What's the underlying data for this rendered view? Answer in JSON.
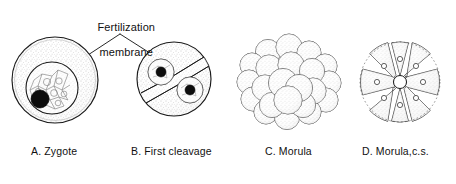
{
  "figure": {
    "width": 456,
    "height": 184,
    "background": "#ffffff",
    "ink_color": "#111111",
    "stipple_color": "#8d8d8d",
    "nucleus_color": "#0d0d0d"
  },
  "callout": {
    "label_line1": "Fertilization",
    "label_line2": "membrane",
    "x": 120,
    "y": 8,
    "apex": {
      "x": 120,
      "y": 34
    },
    "left_target": {
      "x": 88,
      "y": 54
    },
    "right_target": {
      "x": 152,
      "y": 54
    }
  },
  "panels": [
    {
      "id": "A",
      "caption": "A. Zygote",
      "caption_x": 31,
      "caption_y": 145,
      "type": "zygote",
      "center": {
        "x": 55,
        "y": 80
      },
      "radius": 43,
      "inner": {
        "center": {
          "x": 52,
          "y": 88
        },
        "radius": 26,
        "pattern": "polygonal-web"
      },
      "nucleus": {
        "x": 40,
        "y": 99,
        "radius": 9,
        "fill": "solid"
      }
    },
    {
      "id": "B",
      "caption": "B. First cleavage",
      "caption_x": 131,
      "caption_y": 145,
      "type": "first-cleavage",
      "center": {
        "x": 174,
        "y": 79
      },
      "radius": 37,
      "furrow": {
        "angle_deg": -31,
        "gap": 7
      },
      "nuclei": [
        {
          "x": 161,
          "y": 72,
          "radius": 5.0,
          "halo_radius": 13
        },
        {
          "x": 190,
          "y": 90,
          "radius": 5.0,
          "halo_radius": 13
        }
      ]
    },
    {
      "id": "C",
      "caption": "C. Morula",
      "caption_x": 265,
      "caption_y": 145,
      "type": "morula",
      "center": {
        "x": 289,
        "y": 82
      },
      "radius": 44,
      "blastomere_count": 22,
      "blastomere_radius": 13
    },
    {
      "id": "D",
      "caption": "D. Morula,c.s.",
      "caption_x": 362,
      "caption_y": 145,
      "type": "morula-cross-section",
      "center": {
        "x": 400,
        "y": 82
      },
      "radius": 40,
      "wedge_count": 8,
      "cavity_radius": 6.5,
      "wedge_nucleus_radius": 2.6
    }
  ]
}
